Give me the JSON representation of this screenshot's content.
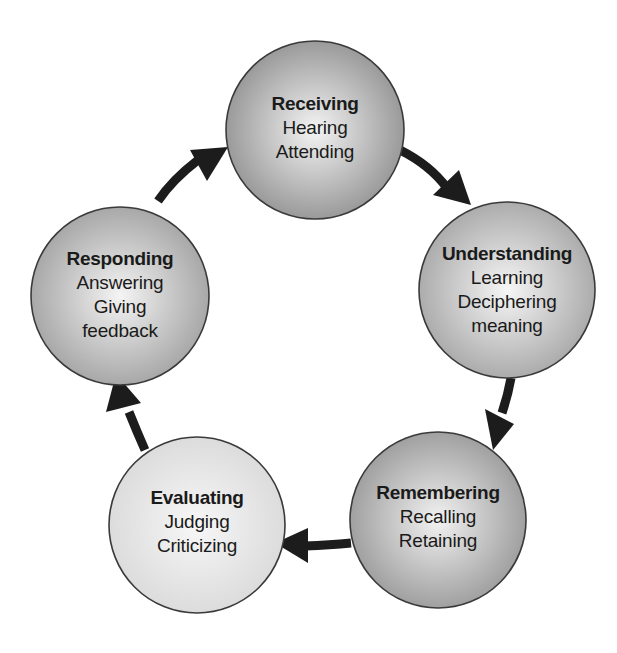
{
  "diagram": {
    "type": "cycle",
    "direction": "clockwise",
    "colors": {
      "arrow": "#1c1c1c",
      "circle_stroke": "#3a3a3a",
      "text": "#1a1a1a"
    },
    "nodes": [
      {
        "id": "receiving",
        "title": "Receiving",
        "lines": [
          "Hearing",
          "Attending"
        ],
        "cx": 315,
        "cy": 130,
        "r": 89,
        "fill_center": "#f4f4f4",
        "fill_edge": "#9a9a9a"
      },
      {
        "id": "understanding",
        "title": "Understanding",
        "lines": [
          "Learning",
          "Deciphering",
          "meaning"
        ],
        "cx": 507,
        "cy": 290,
        "r": 88,
        "fill_center": "#f6f6f6",
        "fill_edge": "#acacac"
      },
      {
        "id": "remembering",
        "title": "Remembering",
        "lines": [
          "Recalling",
          "Retaining"
        ],
        "cx": 438,
        "cy": 520,
        "r": 88,
        "fill_center": "#f2f2f2",
        "fill_edge": "#a0a0a0"
      },
      {
        "id": "evaluating",
        "title": "Evaluating",
        "lines": [
          "Judging",
          "Criticizing"
        ],
        "cx": 197,
        "cy": 525,
        "r": 88,
        "fill_center": "#f7f7f7",
        "fill_edge": "#dcdcdc"
      },
      {
        "id": "responding",
        "title": "Responding",
        "lines": [
          "Answering",
          "Giving",
          "feedback"
        ],
        "cx": 120,
        "cy": 296,
        "r": 89,
        "fill_center": "#f4f4f4",
        "fill_edge": "#a8a8a8"
      }
    ],
    "arrows": [
      {
        "from": "receiving",
        "to": "understanding"
      },
      {
        "from": "understanding",
        "to": "remembering"
      },
      {
        "from": "remembering",
        "to": "evaluating"
      },
      {
        "from": "evaluating",
        "to": "responding"
      },
      {
        "from": "responding",
        "to": "receiving"
      }
    ]
  }
}
